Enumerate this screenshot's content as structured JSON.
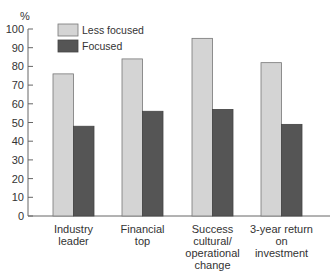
{
  "chart_data": {
    "type": "bar",
    "title": "",
    "xlabel": "",
    "ylabel": "%",
    "ylim": [
      0,
      100
    ],
    "yticks": [
      0,
      10,
      20,
      30,
      40,
      50,
      60,
      70,
      80,
      90,
      100
    ],
    "grid": false,
    "legend_position": "top-left inside",
    "categories": [
      [
        "Industry",
        "leader"
      ],
      [
        "Financial",
        "top"
      ],
      [
        "Success",
        "cultural/",
        "operational",
        "change"
      ],
      [
        "3-year return",
        "on",
        "investment"
      ]
    ],
    "series": [
      {
        "name": "Less focused",
        "color": "#d4d4d4",
        "values": [
          76,
          84,
          95,
          82
        ]
      },
      {
        "name": "Focused",
        "color": "#555555",
        "values": [
          48,
          56,
          57,
          49
        ]
      }
    ]
  }
}
